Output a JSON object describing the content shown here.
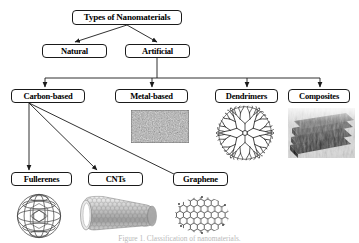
{
  "figure": {
    "title": "Types of Nanomaterials",
    "caption": "Figure 1. Classification of nanomaterials.",
    "colors": {
      "box_border": "#1a1a1a",
      "edge_line": "#1a1a1a",
      "background": "#ffffff",
      "text": "#000000"
    }
  },
  "nodes": {
    "root": {
      "label": "Types of Nanomaterials"
    },
    "level2": [
      {
        "id": "natural",
        "label": "Natural"
      },
      {
        "id": "artificial",
        "label": "Artificial"
      }
    ],
    "level3": [
      {
        "id": "carbon-based",
        "label": "Carbon-based"
      },
      {
        "id": "metal-based",
        "label": "Metal-based"
      },
      {
        "id": "dendrimers",
        "label": "Dendrimers"
      },
      {
        "id": "composites",
        "label": "Composites"
      }
    ],
    "level4": [
      {
        "id": "fullerenes",
        "label": "Fullerenes"
      },
      {
        "id": "cnts",
        "label": "CNTs"
      },
      {
        "id": "graphene",
        "label": "Graphene"
      }
    ]
  },
  "illustrations": [
    {
      "id": "metal-nanoparticle-texture",
      "for": "metal-based",
      "alt": "Metal nanoparticle micrograph"
    },
    {
      "id": "dendrimer-tree",
      "for": "dendrimers",
      "alt": "Branched dendrimer molecule"
    },
    {
      "id": "composite-layers",
      "for": "composites",
      "alt": "Layered nanocomposite micrograph"
    },
    {
      "id": "fullerene-c60",
      "for": "fullerenes",
      "alt": "C60 buckyball"
    },
    {
      "id": "carbon-nanotube",
      "for": "cnts",
      "alt": "Carbon nanotube"
    },
    {
      "id": "graphene-sheet",
      "for": "graphene",
      "alt": "Graphene honeycomb sheet"
    }
  ]
}
